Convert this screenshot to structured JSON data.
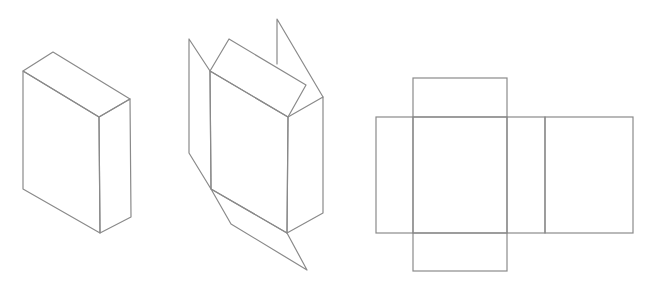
{
  "diagram": {
    "line_color": "#8a8a8a",
    "background": "#ffffff",
    "figures": [
      {
        "id": "closed-box",
        "label": ""
      },
      {
        "id": "unfolding-box",
        "label": ""
      },
      {
        "id": "box-net",
        "label": ""
      }
    ]
  }
}
